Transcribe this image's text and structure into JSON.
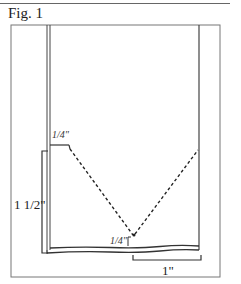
{
  "figure": {
    "caption": "Fig. 1",
    "labels": {
      "top_offset": "1/4\"",
      "left_height": "1 1/2\"",
      "bottom_offset": "1/4\"",
      "bottom_width": "1\""
    },
    "colors": {
      "line": "#333333",
      "frame": "#777777",
      "background": "#ffffff"
    }
  }
}
